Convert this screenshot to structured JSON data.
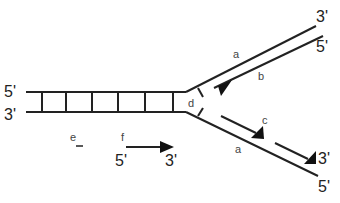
{
  "diagram": {
    "colors": {
      "stroke": "#222222",
      "label": "#444444",
      "background": "#ffffff"
    },
    "parental_duplex": {
      "top_strand_end_label": "5'",
      "bottom_strand_end_label": "3'",
      "rung_count": 6
    },
    "upper_arm": {
      "template_label": "a",
      "template_end_label": "3'",
      "new_strand_label": "b",
      "new_strand_end_label": "5'"
    },
    "lower_arm": {
      "template_label": "a",
      "template_end_label": "5'",
      "fragment_label": "c",
      "fragment_end_label": "3'"
    },
    "fork_label": "d",
    "legend": {
      "e_label": "e",
      "f_label": "f",
      "f_start": "5'",
      "f_end": "3'"
    }
  }
}
